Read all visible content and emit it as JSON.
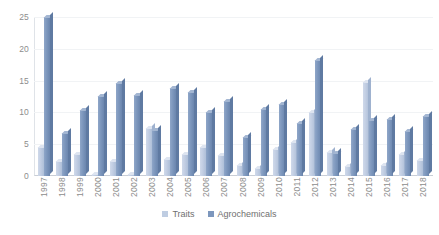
{
  "chart_data": {
    "type": "bar",
    "title": "",
    "xlabel": "",
    "ylabel": "",
    "ylim": [
      0,
      25
    ],
    "yticks": [
      0,
      5,
      10,
      15,
      20,
      25
    ],
    "grid": true,
    "legend_position": "bottom-center",
    "categories": [
      "1997",
      "1998",
      "1999",
      "2000",
      "2001",
      "2002",
      "2003",
      "2004",
      "2005",
      "2006",
      "2007",
      "2008",
      "2009",
      "2010",
      "2011",
      "2012",
      "2013",
      "2014",
      "2015",
      "2016",
      "2017",
      "2018"
    ],
    "series": [
      {
        "name": "Traits",
        "color": "#bfcde2",
        "values": [
          4.5,
          2.4,
          3.4,
          0.3,
          2.4,
          0.3,
          7.6,
          2.6,
          3.5,
          4.6,
          3.3,
          1.7,
          1.2,
          4.2,
          5.3,
          10.0,
          3.8,
          1.5,
          14.8,
          1.8,
          3.4,
          2.5
        ]
      },
      {
        "name": "Agrochemicals",
        "color": "#7d97bd",
        "values": [
          25.0,
          6.8,
          10.4,
          12.6,
          14.6,
          12.8,
          7.2,
          13.8,
          13.2,
          10.0,
          11.8,
          6.1,
          10.6,
          11.3,
          8.4,
          18.3,
          3.6,
          7.4,
          8.8,
          9.0,
          7.1,
          9.4
        ]
      }
    ]
  },
  "legend": {
    "items": [
      {
        "label": "Traits",
        "swatch_name": "legend-swatch-traits"
      },
      {
        "label": "Agrochemicals",
        "swatch_name": "legend-swatch-agrochemicals"
      }
    ]
  },
  "axis": {
    "y_tick_labels": [
      "0",
      "5",
      "10",
      "15",
      "20",
      "25"
    ]
  }
}
